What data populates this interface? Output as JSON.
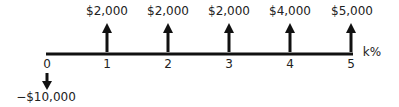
{
  "diagram": {
    "type": "cash-flow-timeline",
    "rate_label": "k%",
    "periods": [
      {
        "t": "0",
        "amount": "−$10,000",
        "direction": "down"
      },
      {
        "t": "1",
        "amount": "$2,000",
        "direction": "up"
      },
      {
        "t": "2",
        "amount": "$2,000",
        "direction": "up"
      },
      {
        "t": "3",
        "amount": "$2,000",
        "direction": "up"
      },
      {
        "t": "4",
        "amount": "$4,000",
        "direction": "up"
      },
      {
        "t": "5",
        "amount": "$5,000",
        "direction": "up"
      }
    ],
    "colors": {
      "line": "#111111",
      "text": "#222222"
    }
  }
}
